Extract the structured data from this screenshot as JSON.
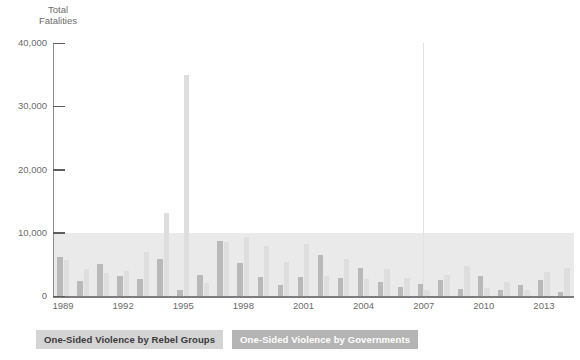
{
  "chart_data": {
    "type": "bar",
    "title": "",
    "ylabel": "Total\nFatalities",
    "xlabel": "",
    "ylim": [
      0,
      40000
    ],
    "yticks": [
      0,
      10000,
      20000,
      30000,
      40000
    ],
    "ytick_labels": [
      "0",
      "10,000",
      "20,000",
      "30,000",
      "40,000"
    ],
    "grid": false,
    "shaded_band": [
      0,
      10000
    ],
    "legend_position": "below-left",
    "categories": [
      "1989",
      "1990",
      "1991",
      "1992",
      "1993",
      "1994",
      "1995",
      "1996",
      "1997",
      "1998",
      "1999",
      "2000",
      "2001",
      "2002",
      "2003",
      "2004",
      "2005",
      "2006",
      "2007",
      "2008",
      "2009",
      "2010",
      "2011",
      "2012",
      "2013",
      "2014"
    ],
    "xtick_labels": [
      "1989",
      "1992",
      "1995",
      "1998",
      "2001",
      "2004",
      "2007",
      "2010",
      "2013"
    ],
    "series": [
      {
        "name": "One-Sided Violence by Rebel Groups",
        "color": "#b9b9b9",
        "values": [
          6200,
          2400,
          5100,
          3100,
          2700,
          5900,
          900,
          3400,
          8700,
          5200,
          3000,
          1800,
          3000,
          6500,
          2900,
          4500,
          2200,
          1400,
          1900,
          2600,
          1100,
          3100,
          1000,
          1800,
          2500,
          700
        ]
      },
      {
        "name": "One-Sided Violence by Governments",
        "color": "#dedede",
        "values": [
          5700,
          4300,
          3600,
          4000,
          6900,
          13200,
          35000,
          2100,
          8600,
          9300,
          7900,
          5400,
          8200,
          3100,
          5900,
          2700,
          4200,
          2800,
          900,
          3300,
          4700,
          1200,
          2200,
          900,
          3800,
          4400
        ]
      }
    ],
    "annotations": []
  },
  "axis": {
    "y_title": "Total\nFatalities"
  },
  "legend": {
    "items": [
      {
        "label": "One-Sided Violence by Rebel Groups",
        "style": "rebel"
      },
      {
        "label": "One-Sided Violence by Governments",
        "style": "gov"
      }
    ]
  }
}
